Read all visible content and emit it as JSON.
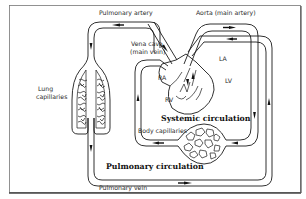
{
  "diagram": {
    "labels": {
      "pulmonary_artery": "Pulmonary artery",
      "aorta": "Aorta (main artery)",
      "vena_cava_line1": "Vena cava",
      "vena_cava_line2": "(main vein)",
      "lung_capillaries_line1": "Lung",
      "lung_capillaries_line2": "capillaries",
      "ra": "RA",
      "la": "LA",
      "rv": "RV",
      "lv": "LV",
      "systemic_circulation": "Systemic circulation",
      "body_capillaries": "Body capillaries",
      "pulmonary_circulation": "Pulmonary circulation",
      "pulmonary_vein": "Pulmonary vein"
    },
    "colors": {
      "line": "#1a1a1a",
      "text": "#2a2a2a",
      "background": "#ffffff",
      "frame": "#555555"
    }
  }
}
